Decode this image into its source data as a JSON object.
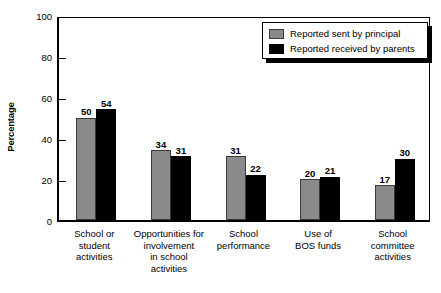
{
  "chart_data": {
    "type": "bar",
    "title": "",
    "subtitle": "",
    "xlabel": "",
    "ylabel": "Percentage",
    "ylim": [
      0,
      100
    ],
    "yticks": [
      0,
      20,
      40,
      60,
      80,
      100
    ],
    "grid": false,
    "legend_position": "top-right",
    "categories": [
      "School or\nstudent\nactivities",
      "Opportunities for\ninvolvement\nin school\nactivities",
      "School\nperformance",
      "Use of\nBOS funds",
      "School\ncommittee\nactivities"
    ],
    "series": [
      {
        "name": "Reported sent by principal",
        "color": "#8a8a8a",
        "values": [
          50,
          34,
          31,
          20,
          17
        ]
      },
      {
        "name": "Reported received by parents",
        "color": "#000000",
        "values": [
          54,
          31,
          22,
          21,
          30
        ]
      }
    ]
  },
  "legend": {
    "items": [
      {
        "label": "Reported sent by principal",
        "swatch": "gray"
      },
      {
        "label": "Reported received by parents",
        "swatch": "black"
      }
    ]
  }
}
